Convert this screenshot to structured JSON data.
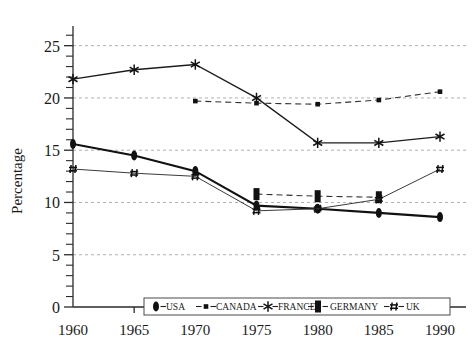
{
  "chart_data": {
    "type": "line",
    "title": "",
    "xlabel": "",
    "ylabel": "Percentage",
    "x": [
      1960,
      1965,
      1970,
      1975,
      1980,
      1985,
      1990
    ],
    "xtick_labels": [
      "1960",
      "1965",
      "1970",
      "1975",
      "1980",
      "1985",
      "1990"
    ],
    "ytick_labels": [
      "0",
      "5",
      "10",
      "15",
      "20",
      "25"
    ],
    "ytick_values": [
      0,
      5,
      10,
      15,
      20,
      25
    ],
    "ylim": [
      0,
      26.5
    ],
    "xlim": [
      1960,
      1990
    ],
    "grid": "horizontal-dashed-major",
    "legend_position": "bottom-inside",
    "minor_ticks_y": 1,
    "series": [
      {
        "name": "USA",
        "marker": "filled-oval",
        "line": "solid-thick",
        "values": [
          15.6,
          14.5,
          13.0,
          9.7,
          9.4,
          9.0,
          8.6
        ]
      },
      {
        "name": "CANADA",
        "marker": "small-square",
        "line": "dashed",
        "values": [
          null,
          null,
          19.7,
          19.5,
          19.4,
          19.8,
          20.6
        ]
      },
      {
        "name": "FRANCE",
        "marker": "asterisk",
        "line": "solid",
        "values": [
          21.8,
          22.7,
          23.2,
          20.0,
          15.7,
          15.7,
          16.3
        ]
      },
      {
        "name": "GERMANY",
        "marker": "filled-rectangle",
        "line": "dashed",
        "values": [
          null,
          null,
          null,
          10.8,
          10.6,
          10.5,
          null
        ]
      },
      {
        "name": "UK",
        "marker": "hash",
        "line": "thin-solid",
        "values": [
          13.2,
          12.8,
          12.5,
          9.2,
          9.4,
          10.3,
          13.2
        ]
      }
    ]
  },
  "legend": {
    "items": [
      {
        "label": "USA",
        "marker": "filled-oval"
      },
      {
        "label": "CANADA",
        "marker": "small-square"
      },
      {
        "label": "FRANCE",
        "marker": "asterisk"
      },
      {
        "label": "GERMANY",
        "marker": "filled-rectangle"
      },
      {
        "label": "UK",
        "marker": "hash"
      }
    ]
  },
  "colors": {
    "ink": "#111111",
    "axis": "#2a2a2a",
    "grid": "#9a9a9a",
    "background": "#ffffff"
  }
}
